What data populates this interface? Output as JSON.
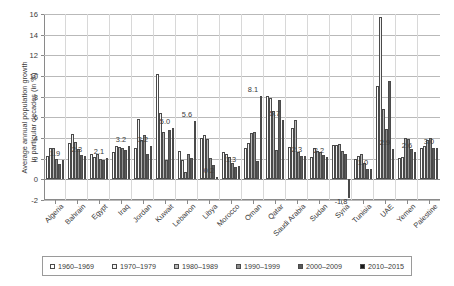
{
  "top_cropped_text": "                                                                                       ",
  "axis": {
    "ylabel_line1": "Average annual population growth",
    "ylabel_line2": "in particular decades (in %)",
    "yticks": [
      16,
      14,
      12,
      10,
      8,
      6,
      4,
      2,
      0,
      -2
    ],
    "ymin": -2,
    "ymax": 16
  },
  "legend": {
    "items": [
      {
        "label": "1960–1969",
        "color": "#ffffff"
      },
      {
        "label": "1970–1979",
        "color": "#f2f2f2"
      },
      {
        "label": "1980–1989",
        "color": "#b8b8b8"
      },
      {
        "label": "1990–1999",
        "color": "#8f8f8f"
      },
      {
        "label": "2000–2009",
        "color": "#5a5a5a"
      },
      {
        "label": "2010–2015",
        "color": "#1a1a1a"
      }
    ]
  },
  "chart_data": {
    "type": "bar",
    "title": "",
    "xlabel": "",
    "ylabel": "Average annual population growth in particular decades (in %)",
    "ylim": [
      -2,
      16
    ],
    "ytick_step": 2,
    "grid": true,
    "legend_position": "bottom",
    "categories": [
      "Algeria",
      "Bahrain",
      "Egypt",
      "Iraq",
      "Jordan",
      "Kuwait",
      "Lebanon",
      "Libya",
      "Morocco",
      "Oman",
      "Qatar",
      "Saudi Arabia",
      "Sudan",
      "Syria",
      "Tunisia",
      "UAE",
      "Yemen",
      "Palestine"
    ],
    "series": [
      {
        "name": "1960–1969",
        "values": [
          2.3,
          3.5,
          2.5,
          2.6,
          3.0,
          10.2,
          2.7,
          4.0,
          2.6,
          3.0,
          8.1,
          3.1,
          2.2,
          3.3,
          2.0,
          9.0,
          2.1,
          3.0
        ]
      },
      {
        "name": "1970–1979",
        "values": [
          3.0,
          4.4,
          2.2,
          3.2,
          5.8,
          6.4,
          1.9,
          4.3,
          2.5,
          3.5,
          7.9,
          5.0,
          3.0,
          3.3,
          2.3,
          15.7,
          2.2,
          3.2
        ]
      },
      {
        "name": "1980–1989",
        "values": [
          3.0,
          3.6,
          2.5,
          3.1,
          3.8,
          4.6,
          0.7,
          3.9,
          2.2,
          4.5,
          6.6,
          5.7,
          2.7,
          3.4,
          2.5,
          6.8,
          4.0,
          3.8
        ]
      },
      {
        "name": "1990–1999",
        "values": [
          2.0,
          2.9,
          2.0,
          3.0,
          4.3,
          1.9,
          2.5,
          2.1,
          1.6,
          4.6,
          2.8,
          2.6,
          2.6,
          2.7,
          1.6,
          4.9,
          3.9,
          4.0
        ]
      },
      {
        "name": "2000–2009",
        "values": [
          1.5,
          2.4,
          1.9,
          2.8,
          2.5,
          4.8,
          2.1,
          1.4,
          1.2,
          1.8,
          7.7,
          2.3,
          2.4,
          2.5,
          1.0,
          9.5,
          2.9,
          3.0
        ]
      },
      {
        "name": "2010–2015",
        "values": [
          1.9,
          2.3,
          2.1,
          3.2,
          3.2,
          5.0,
          5.6,
          0.2,
          1.3,
          8.1,
          5.7,
          2.3,
          2.2,
          -1.8,
          1.0,
          2.9,
          2.6,
          3.0
        ]
      }
    ],
    "data_labels": [
      {
        "category": "Algeria",
        "value": 1.9,
        "text": "1.9"
      },
      {
        "category": "Bahrain",
        "value": 2.3,
        "text": "2.3"
      },
      {
        "category": "Egypt",
        "value": 2.1,
        "text": "2.1"
      },
      {
        "category": "Iraq",
        "value": 3.2,
        "text": "3.2"
      },
      {
        "category": "Jordan",
        "value": 3.2,
        "text": "3.2"
      },
      {
        "category": "Kuwait",
        "value": 5.0,
        "text": "5.0"
      },
      {
        "category": "Lebanon",
        "value": 5.6,
        "text": "5.6"
      },
      {
        "category": "Libya",
        "value": 0.2,
        "text": "0.2"
      },
      {
        "category": "Morocco",
        "value": 1.3,
        "text": "1.3"
      },
      {
        "category": "Oman",
        "value": 8.1,
        "text": "8.1"
      },
      {
        "category": "Qatar",
        "value": 5.7,
        "text": "5.7"
      },
      {
        "category": "Saudi Arabia",
        "value": 2.3,
        "text": "2.3"
      },
      {
        "category": "Sudan",
        "value": 2.2,
        "text": "2.2"
      },
      {
        "category": "Syria",
        "value": -1.8,
        "text": "-1,8"
      },
      {
        "category": "Tunisia",
        "value": 1.0,
        "text": "1.0"
      },
      {
        "category": "UAE",
        "value": 2.9,
        "text": "2.9"
      },
      {
        "category": "Yemen",
        "value": 2.6,
        "text": "2.6"
      },
      {
        "category": "Palestine",
        "value": 3.0,
        "text": "3.0"
      }
    ]
  }
}
